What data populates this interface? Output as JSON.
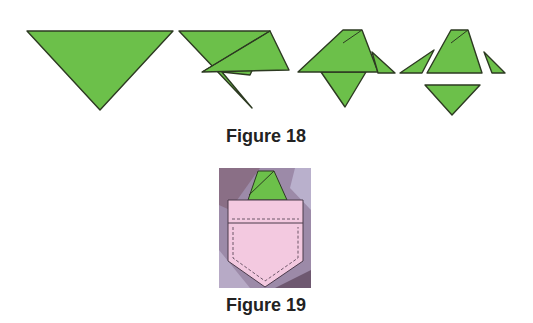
{
  "figures": [
    {
      "caption": "Figure 18",
      "description": "four-step folding sequence of a green triangle"
    },
    {
      "caption": "Figure 19",
      "description": "folded green triangle tucked into a pink pocket"
    }
  ],
  "colors": {
    "green": "#6cc04a",
    "outline": "#2d3a22",
    "pink": "#f3c9e0",
    "pocket_bg": "#9c8aa8"
  }
}
